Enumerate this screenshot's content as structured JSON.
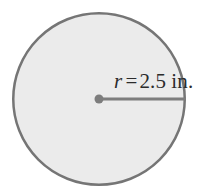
{
  "figure": {
    "type": "geometry-diagram",
    "shape": "circle",
    "background_color": "#ffffff",
    "circle": {
      "fill_color": "#ebebeb",
      "stroke_color": "#757575",
      "stroke_width": 2.5,
      "center_x": 99,
      "center_y": 99,
      "radius_px": 87
    },
    "center_point": {
      "fill_color": "#7d7d7d",
      "radius_px": 4.5
    },
    "radius_line": {
      "stroke_color": "#7d7d7d",
      "stroke_width": 3,
      "from_x": 99,
      "from_y": 99,
      "to_x": 186,
      "to_y": 99
    },
    "label": {
      "variable": "r",
      "equals": "=",
      "value": "2.5",
      "unit": "in.",
      "full_text": "r = 2.5 in.",
      "text_color": "#2b2b2b"
    }
  }
}
